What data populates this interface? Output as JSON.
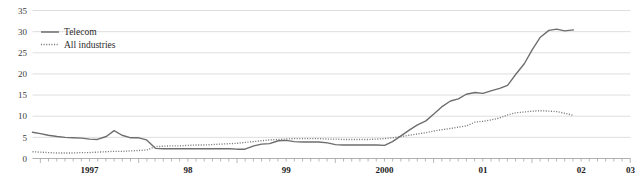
{
  "chart_data": {
    "type": "line",
    "title": "",
    "xlabel": "",
    "ylabel": "",
    "ylim": [
      0,
      35
    ],
    "xlim": [
      1996.92,
      2003.0
    ],
    "grid": true,
    "legend_position": "top-left",
    "y_ticks": [
      0,
      5,
      10,
      15,
      20,
      25,
      30,
      35
    ],
    "y_tick_labels": [
      "0",
      "5",
      "10",
      "15",
      "20",
      "25",
      "30",
      "35"
    ],
    "x_ticks": [
      1997,
      1998,
      1999,
      2000,
      2001,
      2002,
      2003
    ],
    "x_tick_labels": [
      "1997",
      "98",
      "99",
      "2000",
      "01",
      "02",
      "03"
    ],
    "x_minor_tick_interval": 0.0833,
    "series": [
      {
        "name": "Telecom",
        "style": "solid",
        "color": "#6d6d6d",
        "x": [
          1996.92,
          1997.0,
          1997.08,
          1997.17,
          1997.25,
          1997.33,
          1997.42,
          1997.5,
          1997.58,
          1997.67,
          1997.75,
          1997.83,
          1997.92,
          1998.0,
          1998.08,
          1998.17,
          1998.25,
          1998.33,
          1998.42,
          1998.5,
          1998.58,
          1998.67,
          1998.75,
          1998.83,
          1998.92,
          1999.0,
          1999.08,
          1999.17,
          1999.25,
          1999.33,
          1999.42,
          1999.5,
          1999.58,
          1999.67,
          1999.75,
          1999.83,
          1999.92,
          2000.0,
          2000.08,
          2000.17,
          2000.25,
          2000.33,
          2000.42,
          2000.5,
          2000.58,
          2000.67,
          2000.75,
          2000.83,
          2000.92,
          2001.0,
          2001.08,
          2001.17,
          2001.25,
          2001.33,
          2001.42,
          2001.5,
          2001.58,
          2001.67,
          2001.75,
          2001.83,
          2001.92,
          2002.0,
          2002.08,
          2002.17,
          2002.25,
          2002.33,
          2002.42
        ],
        "y": [
          6.2,
          5.9,
          5.5,
          5.2,
          5.0,
          4.9,
          4.8,
          4.6,
          4.5,
          5.2,
          6.6,
          5.5,
          4.9,
          4.9,
          4.4,
          2.4,
          2.3,
          2.3,
          2.3,
          2.3,
          2.3,
          2.3,
          2.3,
          2.3,
          2.3,
          2.2,
          2.2,
          3.0,
          3.4,
          3.5,
          4.2,
          4.3,
          4.0,
          3.9,
          3.9,
          3.9,
          3.7,
          3.3,
          3.2,
          3.2,
          3.2,
          3.2,
          3.2,
          3.1,
          4.0,
          5.4,
          6.7,
          7.9,
          8.9,
          10.5,
          12.2,
          13.6,
          14.1,
          15.2,
          15.6,
          15.4,
          16.0,
          16.6,
          17.3,
          19.8,
          22.4,
          25.7,
          28.6,
          30.3,
          30.6,
          30.2,
          30.4
        ]
      },
      {
        "name": "All industries",
        "style": "dotted",
        "color": "#7b7b7b",
        "x": [
          1996.92,
          1997.0,
          1997.08,
          1997.17,
          1997.25,
          1997.33,
          1997.42,
          1997.5,
          1997.58,
          1997.67,
          1997.75,
          1997.83,
          1997.92,
          1998.0,
          1998.08,
          1998.17,
          1998.25,
          1998.33,
          1998.42,
          1998.5,
          1998.58,
          1998.67,
          1998.75,
          1998.83,
          1998.92,
          1999.0,
          1999.08,
          1999.17,
          1999.25,
          1999.33,
          1999.42,
          1999.5,
          1999.58,
          1999.67,
          1999.75,
          1999.83,
          1999.92,
          2000.0,
          2000.08,
          2000.17,
          2000.25,
          2000.33,
          2000.42,
          2000.5,
          2000.58,
          2000.67,
          2000.75,
          2000.83,
          2000.92,
          2001.0,
          2001.08,
          2001.17,
          2001.25,
          2001.33,
          2001.42,
          2001.5,
          2001.58,
          2001.67,
          2001.75,
          2001.83,
          2001.92,
          2002.0,
          2002.08,
          2002.17,
          2002.25,
          2002.33,
          2002.42
        ],
        "y": [
          1.6,
          1.5,
          1.4,
          1.3,
          1.3,
          1.3,
          1.4,
          1.4,
          1.5,
          1.6,
          1.7,
          1.7,
          1.8,
          1.9,
          2.0,
          2.8,
          2.9,
          3.0,
          3.0,
          3.1,
          3.2,
          3.2,
          3.3,
          3.4,
          3.5,
          3.6,
          3.8,
          4.0,
          4.2,
          4.4,
          4.5,
          4.6,
          4.7,
          4.7,
          4.7,
          4.7,
          4.6,
          4.6,
          4.5,
          4.5,
          4.5,
          4.5,
          4.6,
          4.7,
          4.9,
          5.2,
          5.5,
          5.8,
          6.1,
          6.5,
          6.8,
          7.1,
          7.4,
          7.7,
          8.6,
          8.8,
          9.1,
          9.6,
          10.3,
          10.8,
          11.0,
          11.2,
          11.3,
          11.2,
          11.1,
          10.7,
          10.2
        ]
      }
    ],
    "legend": [
      {
        "label": "Telecom",
        "style": "solid"
      },
      {
        "label": "All industries",
        "style": "dotted"
      }
    ]
  }
}
